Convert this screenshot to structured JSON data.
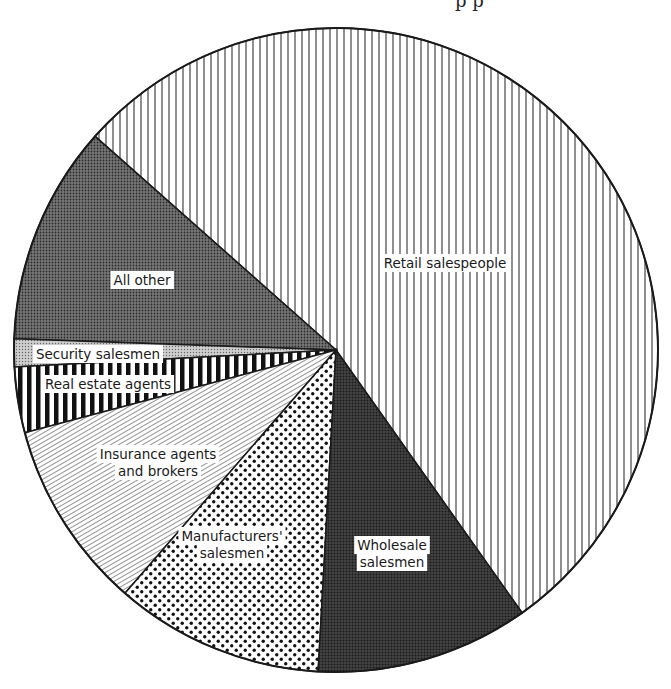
{
  "title_fragment": "p p",
  "chart_data": {
    "type": "pie",
    "title": "",
    "center": [
      336,
      350
    ],
    "radius": 322,
    "start_angle_deg": -54.7,
    "direction": "counterclockwise",
    "slices": [
      {
        "label": "Retail salespeople",
        "value": 53.7,
        "pattern": "vlines",
        "label_lines": [
          "Retail salespeople"
        ],
        "label_pos": [
          445,
          264
        ]
      },
      {
        "label": "All other",
        "value": 11.0,
        "pattern": "darkdots",
        "label_lines": [
          "All other"
        ],
        "label_pos": [
          142,
          281
        ]
      },
      {
        "label": "Security salesmen",
        "value": 1.4,
        "pattern": "lightdots",
        "label_lines": [
          "Security salesmen"
        ],
        "label_pos": [
          98,
          355
        ]
      },
      {
        "label": "Real estate agents",
        "value": 3.3,
        "pattern": "thickvlines",
        "label_lines": [
          "Real estate agents"
        ],
        "label_pos": [
          108,
          385
        ]
      },
      {
        "label": "Insurance agents and brokers",
        "value": 9.5,
        "pattern": "diaglines",
        "label_lines": [
          "Insurance agents",
          "and brokers"
        ],
        "label_pos": [
          158,
          455
        ]
      },
      {
        "label": "Manufacturers' salesmen",
        "value": 10.5,
        "pattern": "bigdots",
        "label_lines": [
          "Manufacturers'",
          "salesmen"
        ],
        "label_pos": [
          232,
          537
        ]
      },
      {
        "label": "Wholesale salesmen",
        "value": 10.7,
        "pattern": "crosshatch",
        "label_lines": [
          "Wholesale",
          "salesmen"
        ],
        "label_pos": [
          392,
          546
        ]
      }
    ],
    "legend": "none",
    "colors": {
      "ink": "#1a1a1a",
      "paper": "#ffffff"
    }
  }
}
